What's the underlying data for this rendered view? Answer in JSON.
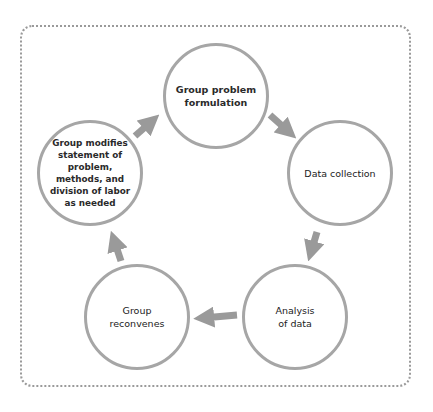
{
  "diagram": {
    "type": "cycle",
    "nodes": [
      {
        "id": "formulation",
        "label": "Group problem\nformulation"
      },
      {
        "id": "collection",
        "label": "Data collection"
      },
      {
        "id": "analysis",
        "label": "Analysis\nof data"
      },
      {
        "id": "reconvene",
        "label": "Group\nreconvenes"
      },
      {
        "id": "modify",
        "label": "Group modifies\nstatement of\nproblem,\nmethods, and\ndivision of labor\nas needed"
      }
    ],
    "edges": [
      {
        "from": "formulation",
        "to": "collection"
      },
      {
        "from": "collection",
        "to": "analysis"
      },
      {
        "from": "analysis",
        "to": "reconvene"
      },
      {
        "from": "reconvene",
        "to": "modify"
      },
      {
        "from": "modify",
        "to": "formulation"
      }
    ],
    "colors": {
      "circle_stroke": "#a6a6a6",
      "arrow": "#9a9a9a",
      "frame": "#9a9a9a",
      "text": "#2a2a2a"
    }
  }
}
